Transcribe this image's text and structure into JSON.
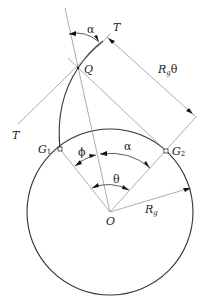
{
  "figure": {
    "type": "involute-of-circle geometry diagram",
    "labels": {
      "alpha_top": "α",
      "T_top": "T",
      "Q": "Q",
      "Rg_theta": "Rgθ",
      "Rg_theta_main": "R",
      "Rg_theta_sub": "g",
      "Rg_theta_suffix": "θ",
      "T_left": "T",
      "G1_main": "G",
      "G1_sub": "1",
      "G2_main": "G",
      "G2_sub": "2",
      "phi": "ϕ",
      "alpha_mid": "α",
      "theta": "θ",
      "O": "O",
      "Rg_main": "R",
      "Rg_sub": "g"
    },
    "geometry": {
      "center_O": [
        110,
        212
      ],
      "radius_Rg": 83,
      "point_G1": [
        60,
        149
      ],
      "point_G2": [
        166,
        151
      ],
      "point_Q": [
        78,
        68
      ],
      "point_T_tangent": [
        107,
        37
      ]
    },
    "colors": {
      "line_dark": "#333333",
      "line_light": "#8a8a8a",
      "background": "#ffffff"
    }
  }
}
